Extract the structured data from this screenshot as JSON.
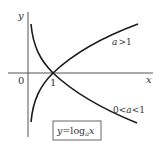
{
  "diagram": {
    "axes": {
      "x_label": "x",
      "y_label": "y",
      "origin_label": "0",
      "tick_label": "1"
    },
    "curves": [
      {
        "name": "increasing",
        "label": "a > 1",
        "label_parts": [
          "a",
          ">1"
        ]
      },
      {
        "name": "decreasing",
        "label": "0 < a < 1",
        "label_parts": [
          "0<",
          "a",
          "<1"
        ]
      }
    ],
    "formula_box": {
      "y": "y",
      "eq": "=",
      "log": "log",
      "base": "a",
      "arg": "x"
    },
    "colors": {
      "axis": "#555555",
      "curve": "#1a1a1a",
      "text": "#333333",
      "box": "#666666"
    }
  }
}
